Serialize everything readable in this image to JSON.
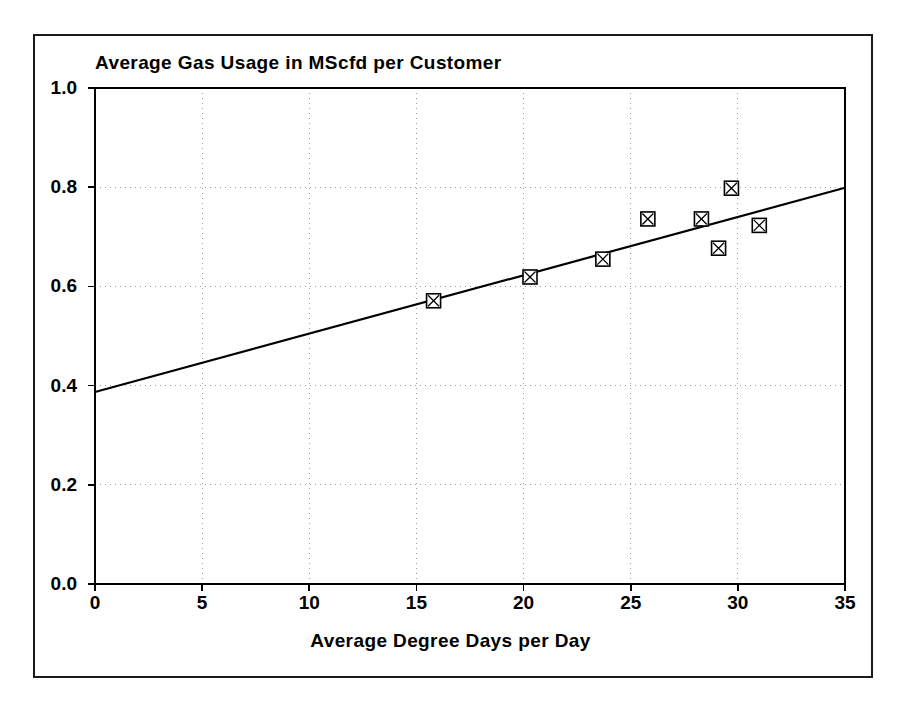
{
  "chart_data": {
    "type": "scatter",
    "title": "Average Gas Usage in MScfd per Customer",
    "xlabel": "Average Degree Days per Day",
    "ylabel": "",
    "xlim": [
      0,
      35
    ],
    "ylim": [
      0.0,
      1.0
    ],
    "grid": true,
    "legend": "none",
    "xticks": [
      "0",
      "5",
      "10",
      "15",
      "20",
      "25",
      "30",
      "35"
    ],
    "xtick_values": [
      0,
      5,
      10,
      15,
      20,
      25,
      30,
      35
    ],
    "yticks": [
      "0.0",
      "0.2",
      "0.4",
      "0.6",
      "0.8",
      "1.0"
    ],
    "ytick_values": [
      0.0,
      0.2,
      0.4,
      0.6,
      0.8,
      1.0
    ],
    "series": [
      {
        "name": "Observed monthly averages",
        "type": "scatter",
        "marker": "square-with-x",
        "marker_color": "#000000",
        "points": [
          {
            "x": 15.8,
            "y": 0.571
          },
          {
            "x": 20.3,
            "y": 0.619
          },
          {
            "x": 23.7,
            "y": 0.655
          },
          {
            "x": 25.8,
            "y": 0.736
          },
          {
            "x": 28.3,
            "y": 0.736
          },
          {
            "x": 29.1,
            "y": 0.677
          },
          {
            "x": 29.7,
            "y": 0.798
          },
          {
            "x": 31.0,
            "y": 0.723
          }
        ]
      },
      {
        "name": "Linear regression fit",
        "type": "line",
        "line_color": "#000000",
        "points": [
          {
            "x": 0,
            "y": 0.387
          },
          {
            "x": 35,
            "y": 0.799
          }
        ]
      }
    ]
  },
  "figure": {
    "background_color": "#ffffff",
    "frame_color": "#1a1a1a",
    "axis_color": "#000000",
    "grid_color": "#9a9a9a"
  }
}
